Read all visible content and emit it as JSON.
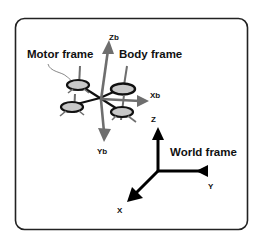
{
  "diagram": {
    "type": "coordinate-frames",
    "labels": {
      "motor_frame": "Motor frame",
      "body_frame": "Body frame",
      "world_frame": "World frame"
    },
    "body_axes": {
      "zb": "Zb",
      "xb": "Xb",
      "yb": "Yb"
    },
    "world_axes": {
      "z": "Z",
      "y": "Y",
      "x": "X"
    },
    "colors": {
      "border": "#222222",
      "body_axis": "#6e6e6e",
      "world_axis": "#000000",
      "rotor_fill": "#c8c8c8",
      "rotor_stroke": "#111111",
      "arm": "#111111"
    }
  }
}
